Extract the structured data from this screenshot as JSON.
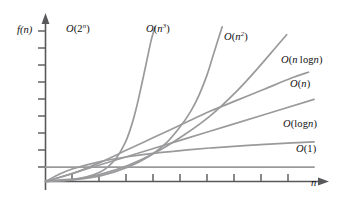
{
  "figure": {
    "axes": {
      "y_label": "f(n)",
      "x_label": "n",
      "y_ticks": 9,
      "x_ticks": 10,
      "axis_color": "#58585a",
      "curve_color": "#9a9a9c",
      "background": "#ffffff"
    },
    "labels": {
      "exp": "O(2^n)",
      "cubic": "O(n^3)",
      "quadratic": "O(n^2)",
      "linearithmic": "O(n log n)",
      "linear": "O(n)",
      "logarithmic": "O(log n)",
      "constant": "O(1)"
    }
  },
  "chart_data": {
    "type": "line",
    "title": "",
    "xlabel": "n",
    "ylabel": "f(n)",
    "xlim": [
      0,
      10
    ],
    "ylim": [
      0,
      10
    ],
    "grid": false,
    "legend": "inline-right",
    "axis_ticks": {
      "x": [
        1,
        2,
        3,
        4,
        5,
        6,
        7,
        8,
        9,
        10
      ],
      "y": [
        1,
        2,
        3,
        4,
        5,
        6,
        7,
        8,
        9
      ]
    },
    "series": [
      {
        "name": "O(2^n)",
        "label": "O(2^n)",
        "color": "#9a9a9c",
        "x": [
          0.0,
          1.0,
          1.5,
          2.0,
          2.3,
          2.6,
          2.9,
          3.1,
          3.3,
          3.5,
          3.7,
          3.85,
          4.0
        ],
        "y": [
          0.05,
          0.15,
          0.3,
          0.6,
          0.95,
          1.5,
          2.4,
          3.3,
          4.5,
          6.0,
          7.6,
          8.8,
          9.7
        ]
      },
      {
        "name": "O(n^3)",
        "label": "O(n^3)",
        "color": "#9a9a9c",
        "x": [
          0.0,
          1.0,
          2.0,
          3.0,
          3.8,
          4.4,
          4.9,
          5.3,
          5.6,
          5.9,
          6.1,
          6.3,
          6.45
        ],
        "y": [
          0.0,
          0.1,
          0.35,
          0.9,
          1.6,
          2.4,
          3.4,
          4.4,
          5.4,
          6.7,
          7.8,
          8.9,
          9.7
        ]
      },
      {
        "name": "O(n^2)",
        "label": "O(n^2)",
        "color": "#9a9a9c",
        "x": [
          0.0,
          1.0,
          2.0,
          3.0,
          4.0,
          5.0,
          6.0,
          7.0,
          7.8,
          8.4,
          8.8
        ],
        "y": [
          0.0,
          0.12,
          0.45,
          1.0,
          1.8,
          2.85,
          4.1,
          5.7,
          7.2,
          8.4,
          9.2
        ]
      },
      {
        "name": "O(n log n)",
        "label": "O(n log n)",
        "color": "#9a9a9c",
        "x": [
          0.0,
          1.0,
          2.0,
          3.0,
          4.0,
          5.0,
          6.0,
          7.0,
          8.0,
          9.0,
          9.6
        ],
        "y": [
          0.0,
          0.5,
          1.2,
          2.0,
          2.8,
          3.6,
          4.4,
          5.1,
          5.8,
          6.5,
          6.85
        ]
      },
      {
        "name": "O(n)",
        "label": "O(n)",
        "color": "#9a9a9c",
        "x": [
          0.0,
          2.0,
          4.0,
          6.0,
          8.0,
          9.8
        ],
        "y": [
          0.0,
          1.05,
          2.1,
          3.15,
          4.2,
          5.15
        ]
      },
      {
        "name": "O(log n)",
        "label": "O(log n)",
        "color": "#9a9a9c",
        "x": [
          0.0,
          0.5,
          1.0,
          2.0,
          3.0,
          4.0,
          5.0,
          6.0,
          7.0,
          8.0,
          9.0,
          9.8
        ],
        "y": [
          0.0,
          0.45,
          0.8,
          1.25,
          1.55,
          1.78,
          1.95,
          2.1,
          2.22,
          2.33,
          2.42,
          2.48
        ]
      },
      {
        "name": "O(1)",
        "label": "O(1)",
        "color": "#9a9a9c",
        "x": [
          0.0,
          9.8
        ],
        "y": [
          0.9,
          0.9
        ]
      }
    ]
  }
}
